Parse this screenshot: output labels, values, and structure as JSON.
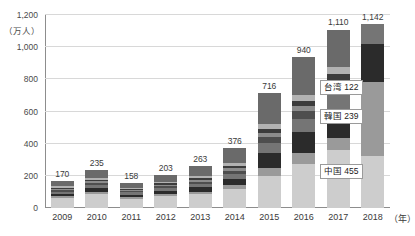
{
  "chart_data": {
    "type": "bar",
    "title": "",
    "subtitle": "",
    "xlabel": "年",
    "ylabel": "万人",
    "ylim": [
      0,
      1200
    ],
    "yticks": [
      0,
      200,
      400,
      600,
      800,
      1000,
      1200
    ],
    "ytick_labels": [
      "0",
      "200",
      "400",
      "600",
      "800",
      "1,000",
      "1,200"
    ],
    "grid": true,
    "stacked": true,
    "legend_position": "none",
    "categories": [
      "2009",
      "2010",
      "2011",
      "2012",
      "2013",
      "2014",
      "2015",
      "2016",
      "2017",
      "2018"
    ],
    "totals": [
      170,
      235,
      158,
      203,
      263,
      376,
      716,
      940,
      1110,
      1142
    ],
    "total_labels": [
      "170",
      "235",
      "158",
      "203",
      "263",
      "376",
      "716",
      "940",
      "1,110",
      "1,142"
    ],
    "series": [
      {
        "name": "その他",
        "color": "#cdcdcd",
        "values": [
          62,
          86,
          58,
          74,
          88,
          118,
          200,
          276,
          360,
          326
        ]
      },
      {
        "name": "中国",
        "color": "#9a9a9a",
        "values": [
          10,
          14,
          10,
          14,
          13,
          24,
          50,
          64,
          74,
          455
        ]
      },
      {
        "name": "韓国",
        "color": "#2b2b2b",
        "values": [
          16,
          22,
          16,
          20,
          27,
          40,
          90,
          130,
          170,
          239
        ]
      },
      {
        "name": "台湾",
        "color": "#757575",
        "values": [
          14,
          20,
          13,
          17,
          22,
          31,
          63,
          83,
          96,
          122
        ]
      },
      {
        "name": "香港",
        "color": "#4e4e4e",
        "values": [
          10,
          13,
          8,
          11,
          15,
          20,
          37,
          48,
          56,
          0
        ]
      },
      {
        "name": "米国",
        "color": "#8c8c8c",
        "values": [
          9,
          12,
          8,
          10,
          12,
          16,
          28,
          35,
          41,
          0
        ]
      },
      {
        "name": "タイ",
        "color": "#3c3c3c",
        "values": [
          6,
          9,
          5,
          7,
          10,
          13,
          25,
          32,
          38,
          0
        ]
      },
      {
        "name": "オーストラリア",
        "color": "#b2b2b2",
        "values": [
          8,
          11,
          7,
          9,
          12,
          16,
          30,
          37,
          44,
          0
        ]
      },
      {
        "name": "その他アジア",
        "color": "#6a6a6a",
        "values": [
          35,
          48,
          33,
          41,
          64,
          98,
          193,
          235,
          231,
          0
        ]
      }
    ],
    "annotations": [
      {
        "name": "china",
        "label": "中国",
        "value": "455",
        "text": "中国 455"
      },
      {
        "name": "korea",
        "label": "韓国",
        "value": "239",
        "text": "韓国 239"
      },
      {
        "name": "taiwan",
        "label": "台湾",
        "value": "122",
        "text": "台湾 122"
      }
    ]
  },
  "axis": {
    "y_unit": "（万人）",
    "x_unit": "（年）"
  },
  "bars_2018_segments": [
    {
      "label": "中国",
      "value": 455,
      "color": "#cdcdcd"
    },
    {
      "label": "韓国",
      "value": 239,
      "color": "#9a9a9a"
    },
    {
      "label": "台湾",
      "value": 122,
      "color": "#2b2b2b"
    },
    {
      "label": "香港",
      "value": 56,
      "color": "#757575"
    },
    {
      "label": "米国",
      "value": 41,
      "color": "#4e4e4e"
    },
    {
      "label": "タイ",
      "value": 38,
      "color": "#8c8c8c"
    },
    {
      "label": "その他",
      "value": 191,
      "color": "#bdbdbd"
    }
  ]
}
